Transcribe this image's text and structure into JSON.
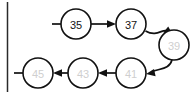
{
  "figure": {
    "background_color": "#ffffff",
    "stroke_color": "#111111",
    "faded_text_color": "#cfcfcf",
    "width": 195,
    "height": 98
  },
  "frame": {
    "left_rule_label": "left-border-rule"
  },
  "nodes": [
    {
      "id": "n1",
      "value": "35",
      "row": "top",
      "cx": 76,
      "cy": 24,
      "r": 15,
      "text_state": "strong"
    },
    {
      "id": "n2",
      "value": "37",
      "row": "top",
      "cx": 131,
      "cy": 24,
      "r": 15,
      "text_state": "strong"
    },
    {
      "id": "n3",
      "value": "39",
      "row": "right",
      "cx": 174,
      "cy": 45,
      "r": 15,
      "text_state": "faded"
    },
    {
      "id": "n4",
      "value": "41",
      "row": "bottom",
      "cx": 131,
      "cy": 73,
      "r": 15,
      "text_state": "faded"
    },
    {
      "id": "n5",
      "value": "43",
      "row": "bottom",
      "cx": 83,
      "cy": 73,
      "r": 15,
      "text_state": "faded"
    },
    {
      "id": "n6",
      "value": "45",
      "row": "bottom",
      "cx": 38,
      "cy": 73,
      "r": 15,
      "text_state": "faded"
    }
  ],
  "edges": [
    {
      "id": "e1",
      "from": "35",
      "to": "37",
      "direction": "right",
      "shape": "straight"
    },
    {
      "id": "e2",
      "from": "37",
      "to": "39",
      "direction": "down-right",
      "shape": "curve"
    },
    {
      "id": "e3",
      "from": "39",
      "to": "41",
      "direction": "down-left",
      "shape": "curve"
    },
    {
      "id": "e4",
      "from": "41",
      "to": "43",
      "direction": "left",
      "shape": "straight"
    },
    {
      "id": "e5",
      "from": "43",
      "to": "45",
      "direction": "left",
      "shape": "straight"
    }
  ],
  "stubs": [
    {
      "id": "s1",
      "attached_to": "35",
      "side": "left",
      "label": "incoming-pointer-stub"
    },
    {
      "id": "s2",
      "attached_to": "45",
      "side": "left",
      "label": "outgoing-pointer-stub"
    }
  ],
  "sequence": [
    "35",
    "37",
    "39",
    "41",
    "43",
    "45"
  ]
}
